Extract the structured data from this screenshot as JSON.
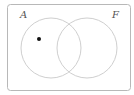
{
  "diagram": {
    "type": "venn",
    "sets": [
      {
        "label": "A",
        "cx": 51,
        "cy": 48,
        "r": 30
      },
      {
        "label": "F",
        "cx": 87,
        "cy": 48,
        "r": 30
      }
    ],
    "point": {
      "region": "A only",
      "x": 39,
      "y": 39
    },
    "colors": {
      "frame": "#b8b8b8",
      "circle": "#cfcfcf",
      "dot": "#111111",
      "label": "#555555"
    }
  }
}
